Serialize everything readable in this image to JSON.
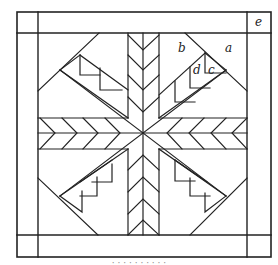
{
  "diagram": {
    "stroke_color": "#222222",
    "background": "#ffffff",
    "labels": [
      {
        "id": "a",
        "text": "a",
        "x": 225,
        "y": 42
      },
      {
        "id": "b",
        "text": "b",
        "x": 178,
        "y": 42
      },
      {
        "id": "c",
        "text": "c",
        "x": 208,
        "y": 65
      },
      {
        "id": "d",
        "text": "d",
        "x": 194,
        "y": 65
      },
      {
        "id": "e",
        "text": "e",
        "x": 255,
        "y": 15
      }
    ],
    "caption": "· · · ·   · · · · · ·"
  }
}
